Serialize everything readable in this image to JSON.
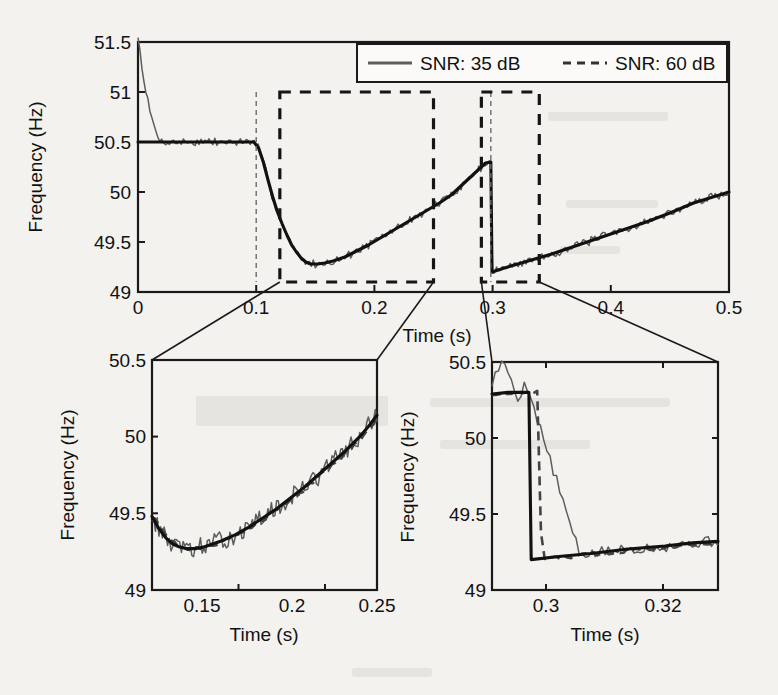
{
  "figure": {
    "background_color": "#f3f2ef",
    "ink_color": "#111111",
    "noisy_trace_color": "#5d5d5d"
  },
  "chart_data": [
    {
      "id": "main",
      "type": "line",
      "title": "",
      "xlabel": "Time (s)",
      "ylabel": "Frequency (Hz)",
      "xlim": [
        0,
        0.5
      ],
      "ylim": [
        49,
        51.5
      ],
      "xticks": [
        0,
        0.1,
        0.2,
        0.3,
        0.4,
        0.5
      ],
      "xticklabels": [
        "0",
        "0.1",
        "0.2",
        "0.3",
        "0.4",
        "0.5"
      ],
      "yticks": [
        49,
        49.5,
        50,
        50.5,
        51,
        51.5
      ],
      "yticklabels": [
        "49",
        "49.5",
        "50",
        "50.5",
        "51",
        "51.5"
      ],
      "grid": false,
      "legend": {
        "position": "top-right",
        "entries": [
          {
            "label": "SNR: 35 dB",
            "style": "solid",
            "color": "#5d5d5d"
          },
          {
            "label": "SNR: 60 dB",
            "style": "dashed",
            "color": "#444444"
          }
        ]
      },
      "series": [
        {
          "name": "reference",
          "style": "solid-thick",
          "description": "piecewise frequency reference: flat 50.5 Hz until 0.1 s, exponential dip to 49.28 Hz, linear ramp to 50.3 Hz at 0.3 s, step down to 49.2 Hz, linear ramp to 50.0 Hz at 0.5 s",
          "points": [
            [
              0.0,
              50.5
            ],
            [
              0.02,
              50.5
            ],
            [
              0.04,
              50.5
            ],
            [
              0.06,
              50.5
            ],
            [
              0.08,
              50.5
            ],
            [
              0.098,
              50.5
            ],
            [
              0.102,
              50.44
            ],
            [
              0.106,
              50.3
            ],
            [
              0.11,
              50.12
            ],
            [
              0.114,
              49.95
            ],
            [
              0.118,
              49.8
            ],
            [
              0.122,
              49.68
            ],
            [
              0.126,
              49.57
            ],
            [
              0.13,
              49.47
            ],
            [
              0.134,
              49.4
            ],
            [
              0.138,
              49.34
            ],
            [
              0.142,
              49.3
            ],
            [
              0.146,
              49.28
            ],
            [
              0.152,
              49.28
            ],
            [
              0.158,
              49.29
            ],
            [
              0.165,
              49.31
            ],
            [
              0.175,
              49.35
            ],
            [
              0.185,
              49.41
            ],
            [
              0.195,
              49.47
            ],
            [
              0.205,
              49.54
            ],
            [
              0.215,
              49.61
            ],
            [
              0.225,
              49.68
            ],
            [
              0.235,
              49.75
            ],
            [
              0.245,
              49.82
            ],
            [
              0.255,
              49.89
            ],
            [
              0.265,
              49.97
            ],
            [
              0.275,
              50.08
            ],
            [
              0.285,
              50.19
            ],
            [
              0.294,
              50.29
            ],
            [
              0.2985,
              50.3
            ],
            [
              0.2995,
              49.2
            ],
            [
              0.31,
              49.24
            ],
            [
              0.33,
              49.31
            ],
            [
              0.35,
              49.38
            ],
            [
              0.37,
              49.46
            ],
            [
              0.39,
              49.54
            ],
            [
              0.41,
              49.62
            ],
            [
              0.43,
              49.7
            ],
            [
              0.45,
              49.79
            ],
            [
              0.47,
              49.89
            ],
            [
              0.5,
              50.0
            ]
          ]
        },
        {
          "name": "SNR: 35 dB",
          "style": "noisy",
          "description": "noisy estimate starting at 51.5 Hz, converging to reference with visible jitter"
        }
      ],
      "annotations": [
        {
          "type": "zoom-box",
          "x0": 0.12,
          "x1": 0.25,
          "y0": 49.1,
          "y1": 51.0,
          "target": "inset-left"
        },
        {
          "type": "zoom-box",
          "x0": 0.2905,
          "x1": 0.3395,
          "y0": 49.1,
          "y1": 51.0,
          "target": "inset-right"
        },
        {
          "type": "guide-line",
          "x": 0.1
        },
        {
          "type": "guide-line",
          "x": 0.2985
        }
      ]
    },
    {
      "id": "inset-left",
      "type": "line",
      "title": "",
      "xlabel": "Time (s)",
      "ylabel": "Frequency (Hz)",
      "xlim": [
        0.12,
        0.25
      ],
      "ylim": [
        49,
        50.5
      ],
      "xticks": [
        0.15,
        0.2,
        0.25
      ],
      "xticklabels": [
        "0.15",
        "0.2",
        "0.25"
      ],
      "yticks": [
        49,
        49.5,
        50,
        50.5
      ],
      "yticklabels": [
        "49",
        "49.5",
        "50",
        "50.5"
      ],
      "grid": false,
      "series": [
        {
          "name": "reference",
          "style": "solid-thick",
          "points": [
            [
              0.12,
              49.48
            ],
            [
              0.124,
              49.4
            ],
            [
              0.128,
              49.34
            ],
            [
              0.132,
              49.3
            ],
            [
              0.136,
              49.28
            ],
            [
              0.14,
              49.27
            ],
            [
              0.145,
              49.27
            ],
            [
              0.15,
              49.28
            ],
            [
              0.155,
              49.3
            ],
            [
              0.16,
              49.32
            ],
            [
              0.168,
              49.36
            ],
            [
              0.176,
              49.41
            ],
            [
              0.184,
              49.47
            ],
            [
              0.192,
              49.53
            ],
            [
              0.2,
              49.6
            ],
            [
              0.208,
              49.67
            ],
            [
              0.216,
              49.75
            ],
            [
              0.224,
              49.83
            ],
            [
              0.232,
              49.91
            ],
            [
              0.24,
              50.0
            ],
            [
              0.246,
              50.08
            ],
            [
              0.25,
              50.14
            ]
          ]
        },
        {
          "name": "SNR: 35 dB",
          "style": "noisy"
        },
        {
          "name": "SNR: 60 dB",
          "style": "dashed"
        }
      ]
    },
    {
      "id": "inset-right",
      "type": "line",
      "title": "",
      "xlabel": "Time (s)",
      "ylabel": "Frequency (Hz)",
      "xlim": [
        0.2905,
        0.3395
      ],
      "ylim": [
        49,
        50.5
      ],
      "xticks": [
        0.3,
        0.32
      ],
      "xticklabels": [
        "0.3",
        "0.32"
      ],
      "yticks": [
        49,
        49.5,
        50,
        50.5
      ],
      "yticklabels": [
        "49",
        "49.5",
        "50",
        "50.5"
      ],
      "grid": false,
      "series": [
        {
          "name": "reference",
          "style": "solid-thick",
          "points": [
            [
              0.2905,
              50.29
            ],
            [
              0.294,
              50.3
            ],
            [
              0.2975,
              50.3
            ],
            [
              0.2985,
              50.3
            ],
            [
              0.299,
              49.2
            ],
            [
              0.305,
              49.22
            ],
            [
              0.312,
              49.24
            ],
            [
              0.32,
              49.27
            ],
            [
              0.328,
              49.29
            ],
            [
              0.334,
              49.31
            ],
            [
              0.3395,
              49.32
            ]
          ]
        },
        {
          "name": "SNR: 35 dB",
          "style": "noisy"
        },
        {
          "name": "SNR: 60 dB",
          "style": "dashed"
        }
      ]
    }
  ]
}
